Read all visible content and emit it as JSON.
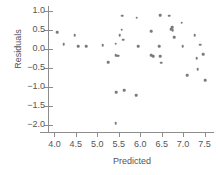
{
  "chart_data": {
    "type": "scatter",
    "title": "",
    "xlabel": "Predicted",
    "ylabel": "Residuals",
    "xlim": [
      3.85,
      7.72
    ],
    "ylim": [
      -2.18,
      1.12
    ],
    "xticks": [
      "4.0",
      "4.5",
      "5.0",
      "5.5",
      "6.0",
      "6.5",
      "7.0",
      "7.5"
    ],
    "xtick_values": [
      4.0,
      4.5,
      5.0,
      5.5,
      6.0,
      6.5,
      7.0,
      7.5
    ],
    "yticks": [
      "1.0",
      "0.5",
      "0.0",
      "−0.5",
      "−1.0",
      "−1.5",
      "−2.0"
    ],
    "ytick_values": [
      1.0,
      0.5,
      0.0,
      -0.5,
      -1.0,
      -1.5,
      -2.0
    ],
    "grid": false,
    "legend": false,
    "marker_color": "#7b7b7b",
    "axis_color": "#8d8d8d",
    "text_color": "#555555",
    "background": "#ffffff",
    "points": [
      [
        4.07,
        0.44
      ],
      [
        4.22,
        0.12
      ],
      [
        4.47,
        0.35
      ],
      [
        4.55,
        0.07
      ],
      [
        4.74,
        0.06
      ],
      [
        5.13,
        0.1
      ],
      [
        5.26,
        -0.35
      ],
      [
        5.43,
        0.13
      ],
      [
        5.43,
        -0.17
      ],
      [
        5.46,
        -0.18
      ],
      [
        5.49,
        -0.18
      ],
      [
        5.52,
        0.36
      ],
      [
        5.57,
        0.5
      ],
      [
        5.58,
        0.87
      ],
      [
        5.6,
        0.24
      ],
      [
        5.44,
        -1.14
      ],
      [
        5.43,
        -1.95
      ],
      [
        5.62,
        -1.09
      ],
      [
        5.9,
        -1.22
      ],
      [
        5.92,
        0.81
      ],
      [
        5.95,
        0.06
      ],
      [
        6.26,
        0.46
      ],
      [
        6.26,
        -0.17
      ],
      [
        6.3,
        -0.2
      ],
      [
        6.44,
        0.06
      ],
      [
        6.46,
        -0.19
      ],
      [
        6.47,
        0.88
      ],
      [
        6.49,
        -0.37
      ],
      [
        6.68,
        0.87
      ],
      [
        6.72,
        0.52
      ],
      [
        6.74,
        0.57
      ],
      [
        6.76,
        0.49
      ],
      [
        6.79,
        0.31
      ],
      [
        6.97,
        0.68
      ],
      [
        6.99,
        0.06
      ],
      [
        7.1,
        -0.7
      ],
      [
        7.27,
        0.36
      ],
      [
        7.32,
        -0.25
      ],
      [
        7.34,
        -0.54
      ],
      [
        7.4,
        0.11
      ],
      [
        7.47,
        -0.14
      ],
      [
        7.52,
        -0.82
      ]
    ]
  }
}
